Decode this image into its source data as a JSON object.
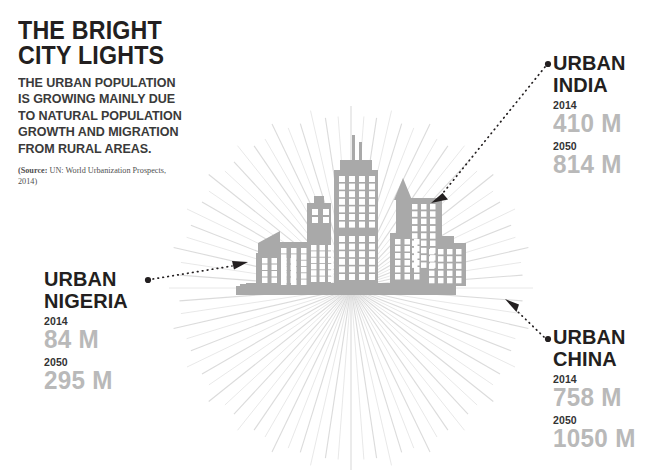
{
  "headline": {
    "title_line1": "THE BRIGHT",
    "title_line2": "CITY LIGHTS",
    "body_line1": "THE URBAN POPULATION",
    "body_line2": "IS GROWING MAINLY DUE",
    "body_line3": "TO NATURAL POPULATION",
    "body_line4": "GROWTH AND MIGRATION",
    "body_line5": "FROM RURAL AREAS.",
    "source_label": "(Source:",
    "source_text": " UN: World Urbanization Prospects, 2014)"
  },
  "callouts": [
    {
      "id": "india",
      "name_line1": "URBAN",
      "name_line2": "INDIA",
      "year_1": "2014",
      "value_1": "410 M",
      "year_2": "2050",
      "value_2": "814 M"
    },
    {
      "id": "china",
      "name_line1": "URBAN",
      "name_line2": "CHINA",
      "year_1": "2014",
      "value_1": "758 M",
      "year_2": "2050",
      "value_2": "1050 M"
    },
    {
      "id": "nigeria",
      "name_line1": "URBAN",
      "name_line2": "NIGERIA",
      "year_1": "2014",
      "value_1": "84 M",
      "year_2": "2050",
      "value_2": "295 M"
    }
  ],
  "chart_data": {
    "type": "bar",
    "title": "THE BRIGHT CITY LIGHTS",
    "subtitle": "THE URBAN POPULATION IS GROWING MAINLY DUE TO NATURAL POPULATION GROWTH AND MIGRATION FROM RURAL AREAS.",
    "source": "(Source: UN: World Urbanization Prospects, 2014)",
    "categories": [
      "Urban India",
      "Urban China",
      "Urban Nigeria"
    ],
    "series": [
      {
        "name": "2014",
        "values": [
          410,
          758,
          84
        ],
        "unit": "M"
      },
      {
        "name": "2050",
        "values": [
          814,
          1050,
          295
        ],
        "unit": "M"
      }
    ],
    "xlabel": "",
    "ylabel": "Urban population (millions)",
    "legend_position": "inline-labels",
    "grid": false
  },
  "colors": {
    "background": "#ffffff",
    "text_dark": "#231f20",
    "text_body": "#3a3a3a",
    "value_gray": "#b9b9b9",
    "city_gray": "#a9a9a9",
    "ray_gray": "#d8d8d8",
    "arrow_dark": "#231f20"
  },
  "illustration": {
    "city_skyline": "city-skyline-silhouette",
    "sunburst": "radiating-light-rays",
    "connectors": [
      "dotted-arrow-india",
      "dotted-arrow-china",
      "dotted-arrow-nigeria"
    ]
  }
}
